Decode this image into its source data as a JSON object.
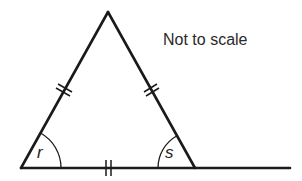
{
  "diagram": {
    "type": "isosceles-triangle-with-extended-base",
    "note": "Not to scale",
    "vertices": {
      "apex": [
        108,
        12
      ],
      "base_left": [
        21,
        168
      ],
      "base_right": [
        195,
        168
      ]
    },
    "baseline_end": [
      290,
      168
    ],
    "angles": [
      {
        "label": "r",
        "vertex": "base_left"
      },
      {
        "label": "s",
        "vertex": "base_right",
        "note": "interior angle at base right"
      }
    ],
    "equal_side_marks": {
      "count_per_side": 2,
      "sides": [
        "left_side",
        "right_side",
        "base"
      ]
    },
    "colors": {
      "line": "#1a1a1a",
      "background": "#ffffff"
    }
  }
}
